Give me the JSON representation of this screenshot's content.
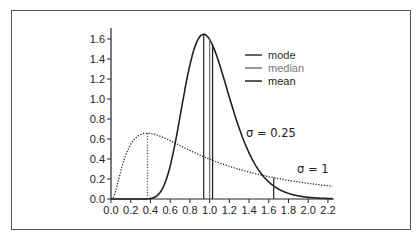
{
  "chart_data": {
    "type": "line",
    "title": "",
    "xlabel": "",
    "ylabel": "",
    "xlim": [
      0.0,
      2.25
    ],
    "ylim": [
      0.0,
      1.7
    ],
    "x_ticks": [
      "0.0",
      "0.2",
      "0.4",
      "0.6",
      "0.8",
      "1.0",
      "1.2",
      "1.4",
      "1.6",
      "1.8",
      "2.0",
      "2.2"
    ],
    "y_ticks": [
      "0.0",
      "0.2",
      "0.4",
      "0.6",
      "0.8",
      "1.0",
      "1.2",
      "1.4",
      "1.6"
    ],
    "grid": false,
    "legend_position": "upper right",
    "legend": [
      {
        "label": "mode",
        "color": "#333333"
      },
      {
        "label": "median",
        "color": "#777777"
      },
      {
        "label": "mean",
        "color": "#222222"
      }
    ],
    "series": [
      {
        "name": "σ = 0.25",
        "distribution": "lognormal",
        "mu": 0,
        "sigma": 0.25,
        "style": "solid",
        "mode": 0.94,
        "median": 1.0,
        "mean": 1.03,
        "peak": 1.65
      },
      {
        "name": "σ = 1",
        "distribution": "lognormal",
        "mu": 0,
        "sigma": 1,
        "style": "dotted",
        "mode": 0.37,
        "median": 1.0,
        "mean": 1.65,
        "peak": 0.66
      }
    ],
    "annotations": [
      {
        "text": "σ = 0.25",
        "x": 1.2,
        "y": 0.55
      },
      {
        "text": "σ = 1",
        "x": 1.72,
        "y": 0.3
      }
    ]
  }
}
